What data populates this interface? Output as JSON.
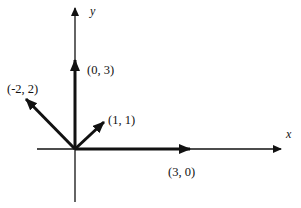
{
  "diagram": {
    "type": "vector-diagram",
    "axes": {
      "x_label": "x",
      "y_label": "y"
    },
    "vectors": [
      {
        "id": "v1",
        "label": "(0, 3)",
        "x": 0,
        "y": 3
      },
      {
        "id": "v2",
        "label": "(-2, 2)",
        "x": -2,
        "y": 2
      },
      {
        "id": "v3",
        "label": "(1, 1)",
        "x": 1,
        "y": 1
      },
      {
        "id": "v4",
        "label": "(3, 0)",
        "x": 3,
        "y": 0
      }
    ],
    "colors": {
      "stroke": "#111111",
      "background": "#ffffff"
    }
  }
}
